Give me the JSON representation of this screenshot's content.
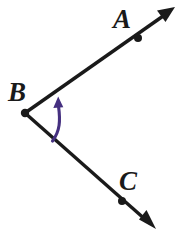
{
  "figure": {
    "kind": "geometry-angle-diagram",
    "width": 178,
    "height": 232,
    "background_color": "#ffffff",
    "stroke_color": "#1a1a1a",
    "arc_color": "#453080",
    "labels": {
      "a": "A",
      "b": "B",
      "c": "C"
    },
    "label_positions": {
      "a": {
        "x": 113,
        "y": 28
      },
      "b": {
        "x": 8,
        "y": 101
      },
      "c": {
        "x": 119,
        "y": 190
      }
    },
    "points": {
      "vertex_b": {
        "x": 25,
        "y": 113
      },
      "point_a": {
        "x": 138,
        "y": 38
      },
      "point_c": {
        "x": 122,
        "y": 201
      }
    },
    "rays": [
      {
        "name": "ray-ba",
        "from": {
          "x": 25,
          "y": 113
        },
        "to": {
          "x": 170,
          "y": 11
        },
        "arrow_tip": {
          "x": 174,
          "y": 8
        }
      },
      {
        "name": "ray-bc",
        "from": {
          "x": 25,
          "y": 113
        },
        "to": {
          "x": 151,
          "y": 225
        },
        "arrow_tip": {
          "x": 155,
          "y": 229
        }
      }
    ],
    "arc": {
      "name": "angle-arc",
      "start": {
        "x": 52,
        "y": 140
      },
      "end": {
        "x": 58,
        "y": 104
      },
      "arrow_tip": {
        "x": 58,
        "y": 97
      },
      "direction": "counterclockwise-upward"
    }
  }
}
